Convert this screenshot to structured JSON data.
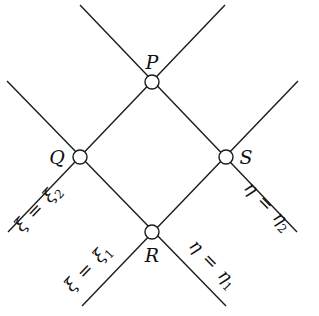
{
  "diagram": {
    "type": "characteristic-grid",
    "colors": {
      "stroke": "#1a1a1a",
      "background": "#ffffff"
    },
    "nodes": [
      {
        "id": "P",
        "label": "P",
        "x": 152,
        "y": 82
      },
      {
        "id": "Q",
        "label": "Q",
        "x": 80,
        "y": 157
      },
      {
        "id": "S",
        "label": "S",
        "x": 226,
        "y": 157
      },
      {
        "id": "R",
        "label": "R",
        "x": 152,
        "y": 232
      }
    ],
    "lines": [
      {
        "id": "eta-2",
        "from": [
          80,
          5
        ],
        "to": [
          297,
          232
        ],
        "label_var": "η",
        "label_eq": "=",
        "label_sym": "η",
        "label_sub": "2"
      },
      {
        "id": "xi-2",
        "from": [
          225,
          5
        ],
        "to": [
          8,
          232
        ],
        "label_var": "ξ",
        "label_eq": "=",
        "label_sym": "ξ",
        "label_sub": "2"
      },
      {
        "id": "eta-1",
        "from": [
          7,
          81
        ],
        "to": [
          226,
          306
        ],
        "label_var": "η",
        "label_eq": "=",
        "label_sym": "η",
        "label_sub": "1"
      },
      {
        "id": "xi-1",
        "from": [
          298,
          81
        ],
        "to": [
          82,
          306
        ],
        "label_var": "ξ",
        "label_eq": "=",
        "label_sym": "ξ",
        "label_sub": "1"
      }
    ]
  }
}
